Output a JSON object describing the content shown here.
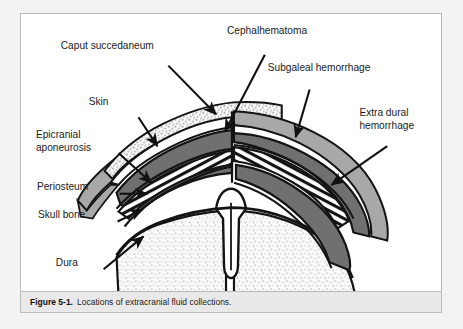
{
  "figure": {
    "caption_number": "Figure 5-1.",
    "caption_text": "Locations of extracranial fluid collections.",
    "title": "Locations of extracranial fluid collections"
  },
  "colors": {
    "page_background": "#f3f3f3",
    "frame_background": "#ffffff",
    "frame_border": "#b9b9b9",
    "caption_background": "#e9e9e9",
    "outline": "#111111",
    "hemorrhage_dark_gray": "#707070",
    "skin_medium_gray": "#a8a8a8",
    "edema_stipple": "#d8d8d8",
    "brain_stipple": "#e2e2e2",
    "bone_white": "#ffffff",
    "text": "#1b1b1b"
  },
  "labels": [
    {
      "id": "caput-succedaneum",
      "text": "Caput succedaneum",
      "x": 57,
      "y": 42,
      "leader": {
        "x1": 148,
        "y1": 52,
        "x2": 196,
        "y2": 101
      }
    },
    {
      "id": "cephalhematoma",
      "text": "Cephalhematoma",
      "x": 224,
      "y": 27,
      "leader": {
        "x1": 245,
        "y1": 41,
        "x2": 205,
        "y2": 118
      }
    },
    {
      "id": "subgaleal-hemorrhage",
      "text": "Subgaleal hemorrhage",
      "x": 265,
      "y": 64,
      "leader": {
        "x1": 290,
        "y1": 76,
        "x2": 276,
        "y2": 124
      }
    },
    {
      "id": "skin",
      "text": "Skin",
      "x": 85,
      "y": 99,
      "leader": {
        "x1": 118,
        "y1": 104,
        "x2": 137,
        "y2": 133
      }
    },
    {
      "id": "epicranial-aponeurosis",
      "text": "Epicranial",
      "text2": "aponeurosis",
      "x": 32,
      "y": 132,
      "leader": {
        "x1": 98,
        "y1": 140,
        "x2": 131,
        "y2": 170
      }
    },
    {
      "id": "extra-dural-hemorrhage",
      "text": "Extra dural",
      "text2": "hemorrhage",
      "x": 357,
      "y": 110,
      "leader": {
        "x1": 368,
        "y1": 133,
        "x2": 312,
        "y2": 172
      }
    },
    {
      "id": "periosteum",
      "text": "Periosteum",
      "x": 33,
      "y": 184,
      "leader": {
        "x1": 99,
        "y1": 181,
        "x2": 127,
        "y2": 181
      }
    },
    {
      "id": "skull-bone",
      "text": "Skull bone",
      "x": 34,
      "y": 212,
      "leader": {
        "x1": 97,
        "y1": 209,
        "x2": 122,
        "y2": 197
      }
    },
    {
      "id": "dura",
      "text": "Dura",
      "x": 52,
      "y": 261,
      "leader": {
        "x1": 83,
        "y1": 257,
        "x2": 123,
        "y2": 224
      }
    }
  ],
  "anatomy": {
    "structures": [
      "scalp-edema-caput-succedaneum",
      "skin-layer",
      "epicranial-aponeurosis",
      "subgaleal-hemorrhage",
      "cephalhematoma",
      "periosteum",
      "skull-bone-diploe",
      "extra-dural-hemorrhage",
      "dura-mater",
      "brain",
      "falx-cerebri-midline"
    ]
  }
}
